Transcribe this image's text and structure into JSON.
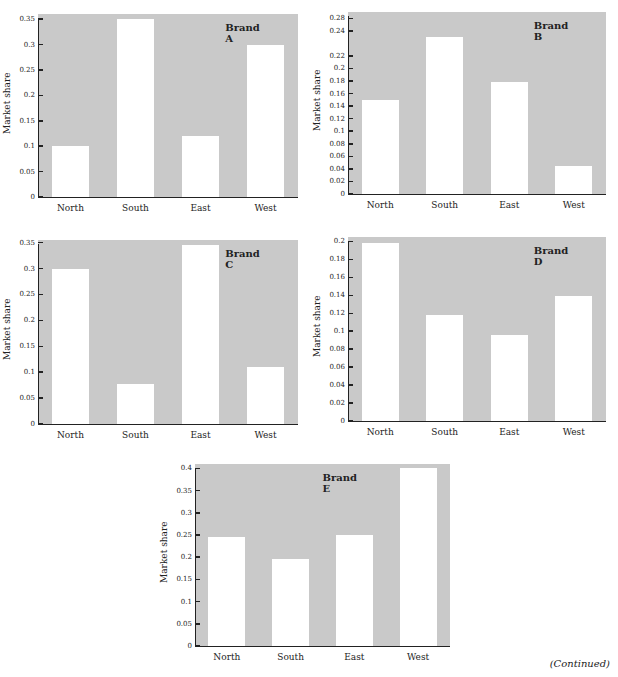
{
  "footer": {
    "continued": "(Continued)"
  },
  "layout": [
    {
      "left": 8,
      "top": 12,
      "plotLeft": 38,
      "plotTop": 14,
      "plotW": 260,
      "plotH": 183
    },
    {
      "left": 318,
      "top": 10,
      "plotLeft": 348,
      "plotTop": 12,
      "plotW": 258,
      "plotH": 182
    },
    {
      "left": 8,
      "top": 238,
      "plotLeft": 38,
      "plotTop": 240,
      "plotW": 260,
      "plotH": 184
    },
    {
      "left": 318,
      "top": 235,
      "plotLeft": 348,
      "plotTop": 237,
      "plotW": 258,
      "plotH": 184
    },
    {
      "left": 165,
      "top": 462,
      "plotLeft": 195,
      "plotTop": 464,
      "plotW": 255,
      "plotH": 182
    }
  ],
  "chart_data": [
    {
      "type": "bar",
      "title": "Brand A",
      "xlabel": "",
      "ylabel": "Market share",
      "categories": [
        "North",
        "South",
        "East",
        "West"
      ],
      "values": [
        0.1,
        0.35,
        0.12,
        0.3
      ],
      "ylim": [
        0,
        0.36
      ],
      "yticks": [
        0,
        0.05,
        0.1,
        0.15,
        0.2,
        0.25,
        0.3,
        0.35
      ],
      "ytick_labels": [
        "0",
        "0.05",
        "0.1",
        "0.15",
        "0.2",
        "0.25",
        "0.3",
        "0.35"
      ],
      "grid": false,
      "legend": null,
      "colors": {
        "background": "#c9c9c9",
        "bars": "#ffffff"
      }
    },
    {
      "type": "bar",
      "title": "Brand B",
      "xlabel": "",
      "ylabel": "Market share",
      "categories": [
        "North",
        "South",
        "East",
        "West"
      ],
      "values": [
        0.15,
        0.25,
        0.178,
        0.045
      ],
      "ylim": [
        0,
        0.29
      ],
      "yticks": [
        0,
        0.02,
        0.04,
        0.06,
        0.08,
        0.1,
        0.12,
        0.14,
        0.16,
        0.18,
        0.2,
        0.22,
        0.26,
        0.28
      ],
      "ytick_labels": [
        "0",
        "0.02",
        "0.04",
        "0.06",
        "0.08",
        "0.1",
        "0.12",
        "0.14",
        "0.16",
        "0.18",
        "0.2",
        "0.22",
        "0.24",
        "0.28"
      ],
      "grid": false,
      "legend": null,
      "colors": {
        "background": "#c9c9c9",
        "bars": "#ffffff"
      }
    },
    {
      "type": "bar",
      "title": "Brand C",
      "xlabel": "",
      "ylabel": "Market share",
      "categories": [
        "North",
        "South",
        "East",
        "West"
      ],
      "values": [
        0.3,
        0.078,
        0.345,
        0.11
      ],
      "ylim": [
        0,
        0.355
      ],
      "yticks": [
        0,
        0.05,
        0.1,
        0.15,
        0.2,
        0.25,
        0.3,
        0.35
      ],
      "ytick_labels": [
        "0",
        "0.05",
        "0.1",
        "0.15",
        "0.2",
        "0.25",
        "0.3",
        "0.35"
      ],
      "grid": false,
      "legend": null,
      "colors": {
        "background": "#c9c9c9",
        "bars": "#ffffff"
      }
    },
    {
      "type": "bar",
      "title": "Brand D",
      "xlabel": "",
      "ylabel": "Market share",
      "categories": [
        "North",
        "South",
        "East",
        "West"
      ],
      "values": [
        0.198,
        0.118,
        0.096,
        0.139
      ],
      "ylim": [
        0,
        0.205
      ],
      "yticks": [
        0,
        0.02,
        0.04,
        0.06,
        0.08,
        0.1,
        0.12,
        0.14,
        0.16,
        0.18,
        0.2
      ],
      "ytick_labels": [
        "0",
        "0.02",
        "0.04",
        "0.06",
        "0.08",
        "0.1",
        "0.12",
        "0.14",
        "0.16",
        "0.18",
        "0.2"
      ],
      "grid": false,
      "legend": null,
      "colors": {
        "background": "#c9c9c9",
        "bars": "#ffffff"
      }
    },
    {
      "type": "bar",
      "title": "Brand E",
      "xlabel": "",
      "ylabel": "Market share",
      "categories": [
        "North",
        "South",
        "East",
        "West"
      ],
      "values": [
        0.245,
        0.195,
        0.25,
        0.4
      ],
      "ylim": [
        0,
        0.41
      ],
      "yticks": [
        0,
        0.05,
        0.1,
        0.15,
        0.2,
        0.25,
        0.3,
        0.35,
        0.4
      ],
      "ytick_labels": [
        "0",
        "0.05",
        "0.1",
        "0.15",
        "0.2",
        "0.25",
        "0.3",
        "0.35",
        "0.4"
      ],
      "grid": false,
      "legend": null,
      "colors": {
        "background": "#c9c9c9",
        "bars": "#ffffff"
      }
    }
  ]
}
